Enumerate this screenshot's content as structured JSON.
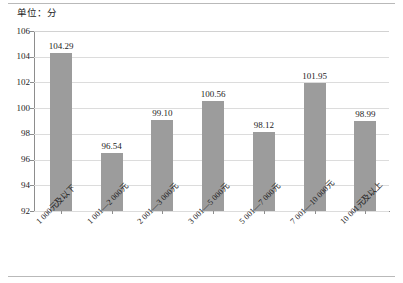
{
  "chart_data": {
    "type": "bar",
    "title": "单位：分",
    "xlabel": "",
    "ylabel": "",
    "ylim": [
      92,
      106
    ],
    "ytick_step": 2,
    "yticks": [
      106,
      104,
      102,
      100,
      98,
      96,
      94,
      92
    ],
    "grid": true,
    "legend": null,
    "categories": [
      "1 000元及以下",
      "1 001—2 000元",
      "2 001—3 000元",
      "3 001—5 000元",
      "5 001—7 000元",
      "7 001—10 000元",
      "10 001元及以上"
    ],
    "values": [
      104.29,
      96.54,
      99.1,
      100.56,
      98.12,
      101.95,
      98.99
    ],
    "value_labels": [
      "104.29",
      "96.54",
      "99.10",
      "100.56",
      "98.12",
      "101.95",
      "98.99"
    ],
    "bar_color": "#9c9c9c",
    "grid_color": "#dcdcdc",
    "axis_color": "#8d8d8d"
  }
}
